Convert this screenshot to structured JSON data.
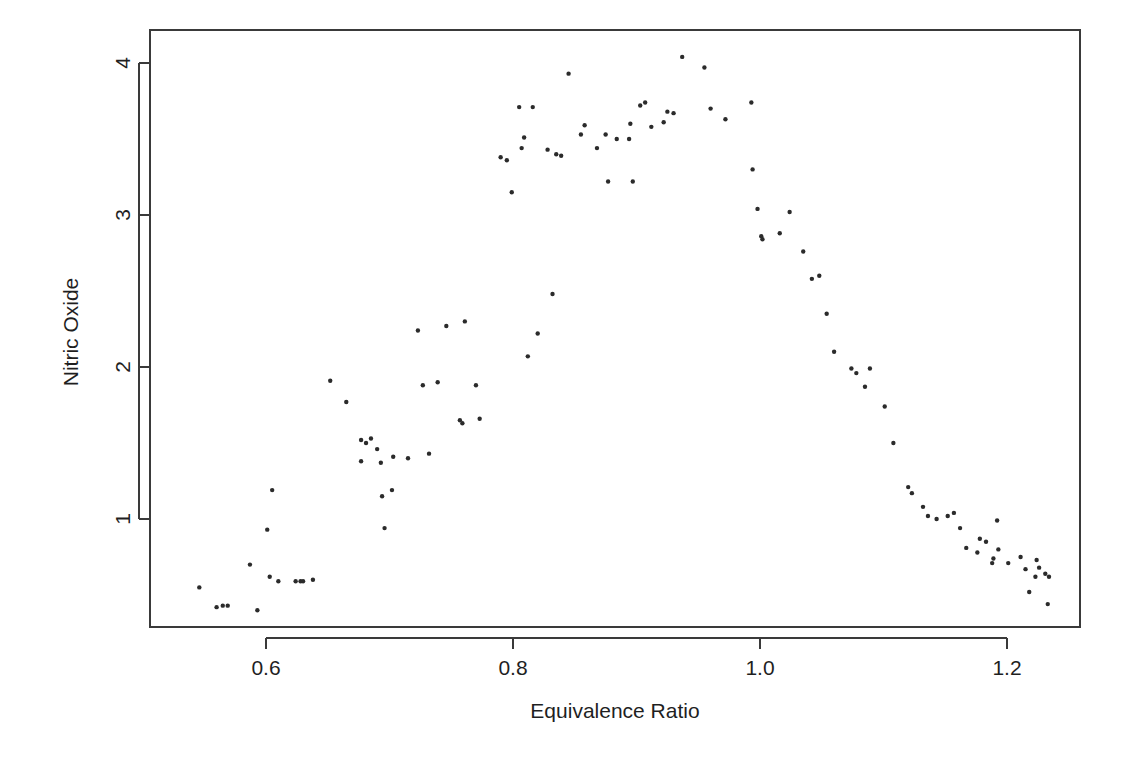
{
  "chart_data": {
    "type": "scatter",
    "title": "",
    "subtitle": "",
    "xlabel": "Equivalence Ratio",
    "ylabel": "Nitric Oxide",
    "xlim": [
      0.515,
      1.245
    ],
    "ylim": [
      0.33,
      4.18
    ],
    "xticks": [
      0.6,
      0.8,
      1.0,
      1.2
    ],
    "xticklabels": [
      "0.6",
      "0.8",
      "1.0",
      "1.2"
    ],
    "yticks": [
      1,
      2,
      3,
      4
    ],
    "yticklabels": [
      "1",
      "2",
      "3",
      "4"
    ],
    "grid": false,
    "legend": null,
    "legend_position": "none",
    "marker": "filled-circle",
    "marker_color": "#2b2b2b",
    "marker_size_px": 4.4,
    "n_points": 88,
    "series": [
      {
        "name": "Nitric Oxide",
        "x": [
          0.907,
          0.761,
          1.108,
          1.016,
          1.189,
          1.001,
          1.231,
          1.123,
          1.042,
          1.215,
          0.93,
          1.152,
          0.693,
          0.839,
          0.759,
          0.835,
          0.994,
          1.101,
          1.189,
          1.132,
          0.993,
          1.223,
          0.723,
          0.677,
          1.002,
          0.681,
          0.855,
          0.839,
          0.732,
          0.79,
          0.895,
          0.912,
          0.937,
          0.805,
          0.807,
          0.955,
          0.799,
          1.189,
          0.816,
          0.922,
          1.089,
          1.035,
          0.739,
          0.875,
          0.624,
          1.201,
          1.188,
          0.828,
          0.998,
          0.858,
          1.048,
          0.757,
          1.074,
          0.727,
          0.77,
          1.189,
          0.894,
          0.96,
          0.546,
          0.773,
          0.677,
          1.182,
          0.795,
          0.603,
          0.702,
          0.897,
          1.224,
          0.628,
          0.569,
          0.593,
          1.143,
          0.746,
          0.677,
          0.703,
          0.63,
          0.567,
          0.56,
          0.565,
          0.61,
          1.192,
          1.178,
          1.162,
          1.193,
          1.183,
          1.176,
          1.226,
          1.218,
          1.211
        ],
        "y": [
          3.741,
          2.295,
          1.498,
          2.881,
          0.76,
          3.12,
          0.638,
          1.17,
          2.358,
          0.671,
          3.67,
          1.018,
          1.37,
          3.54,
          2.3,
          3.4,
          3.3,
          1.87,
          0.74,
          1.08,
          2.88,
          0.62,
          2.24,
          1.4,
          2.84,
          1.34,
          3.53,
          3.39,
          1.43,
          3.38,
          3.6,
          4.04,
          3.97,
          3.71,
          3.44,
          3.73,
          3.15,
          0.78,
          3.71,
          3.61,
          1.99,
          2.44,
          1.9,
          3.53,
          0.59,
          0.71,
          0.71,
          3.43,
          3.04,
          3.59,
          2.58,
          2.08,
          1.99,
          1.88,
          3.35,
          0.84,
          3.5,
          3.7,
          0.55,
          3.4,
          1.38,
          1.01,
          3.36,
          0.62,
          1.19,
          3.22,
          0.73,
          0.59,
          0.43,
          0.4,
          1.0,
          2.27,
          1.14,
          1.65,
          0.59,
          0.43,
          0.42,
          0.94,
          1.2,
          0.99,
          0.87,
          0.94,
          0.8,
          0.85,
          0.78,
          0.68,
          0.52,
          0.75
        ]
      }
    ],
    "points": [
      [
        0.546,
        0.55
      ],
      [
        0.56,
        0.42
      ],
      [
        0.565,
        0.43
      ],
      [
        0.569,
        0.43
      ],
      [
        0.593,
        0.4
      ],
      [
        0.603,
        0.62
      ],
      [
        0.605,
        1.19
      ],
      [
        0.601,
        0.93
      ],
      [
        0.587,
        0.7
      ],
      [
        0.61,
        0.59
      ],
      [
        0.624,
        0.59
      ],
      [
        0.628,
        0.59
      ],
      [
        0.63,
        0.59
      ],
      [
        0.638,
        0.6
      ],
      [
        0.652,
        1.91
      ],
      [
        0.665,
        1.77
      ],
      [
        0.677,
        1.38
      ],
      [
        0.677,
        1.52
      ],
      [
        0.681,
        1.5
      ],
      [
        0.685,
        1.53
      ],
      [
        0.69,
        1.46
      ],
      [
        0.693,
        1.37
      ],
      [
        0.694,
        1.15
      ],
      [
        0.696,
        0.94
      ],
      [
        0.702,
        1.19
      ],
      [
        0.703,
        1.41
      ],
      [
        0.715,
        1.4
      ],
      [
        0.723,
        2.24
      ],
      [
        0.727,
        1.88
      ],
      [
        0.732,
        1.43
      ],
      [
        0.739,
        1.9
      ],
      [
        0.746,
        2.27
      ],
      [
        0.757,
        1.65
      ],
      [
        0.759,
        1.63
      ],
      [
        0.761,
        2.3
      ],
      [
        0.77,
        1.88
      ],
      [
        0.773,
        1.66
      ],
      [
        0.79,
        3.38
      ],
      [
        0.795,
        3.36
      ],
      [
        0.799,
        3.15
      ],
      [
        0.805,
        3.71
      ],
      [
        0.807,
        3.44
      ],
      [
        0.809,
        3.51
      ],
      [
        0.812,
        2.07
      ],
      [
        0.816,
        3.71
      ],
      [
        0.82,
        2.22
      ],
      [
        0.828,
        3.43
      ],
      [
        0.832,
        2.48
      ],
      [
        0.835,
        3.4
      ],
      [
        0.839,
        3.39
      ],
      [
        0.845,
        3.93
      ],
      [
        0.855,
        3.53
      ],
      [
        0.858,
        3.59
      ],
      [
        0.868,
        3.44
      ],
      [
        0.875,
        3.53
      ],
      [
        0.877,
        3.22
      ],
      [
        0.884,
        3.5
      ],
      [
        0.894,
        3.5
      ],
      [
        0.895,
        3.6
      ],
      [
        0.897,
        3.22
      ],
      [
        0.903,
        3.72
      ],
      [
        0.907,
        3.74
      ],
      [
        0.912,
        3.58
      ],
      [
        0.922,
        3.61
      ],
      [
        0.925,
        3.68
      ],
      [
        0.93,
        3.67
      ],
      [
        0.937,
        4.04
      ],
      [
        0.955,
        3.97
      ],
      [
        0.96,
        3.7
      ],
      [
        0.972,
        3.63
      ],
      [
        0.993,
        3.74
      ],
      [
        0.994,
        3.3
      ],
      [
        0.998,
        3.04
      ],
      [
        1.001,
        2.86
      ],
      [
        1.002,
        2.84
      ],
      [
        1.016,
        2.88
      ],
      [
        1.024,
        3.02
      ],
      [
        1.035,
        2.76
      ],
      [
        1.042,
        2.58
      ],
      [
        1.048,
        2.6
      ],
      [
        1.054,
        2.35
      ],
      [
        1.06,
        2.1
      ],
      [
        1.074,
        1.99
      ],
      [
        1.078,
        1.96
      ],
      [
        1.085,
        1.87
      ],
      [
        1.089,
        1.99
      ],
      [
        1.101,
        1.74
      ],
      [
        1.108,
        1.5
      ],
      [
        1.12,
        1.21
      ],
      [
        1.123,
        1.17
      ],
      [
        1.132,
        1.08
      ],
      [
        1.136,
        1.02
      ],
      [
        1.143,
        1.0
      ],
      [
        1.152,
        1.02
      ],
      [
        1.157,
        1.04
      ],
      [
        1.162,
        0.94
      ],
      [
        1.167,
        0.81
      ],
      [
        1.176,
        0.78
      ],
      [
        1.178,
        0.87
      ],
      [
        1.183,
        0.85
      ],
      [
        1.188,
        0.71
      ],
      [
        1.189,
        0.74
      ],
      [
        1.192,
        0.99
      ],
      [
        1.193,
        0.8
      ],
      [
        1.201,
        0.71
      ],
      [
        1.211,
        0.75
      ],
      [
        1.215,
        0.67
      ],
      [
        1.218,
        0.52
      ],
      [
        1.223,
        0.62
      ],
      [
        1.224,
        0.73
      ],
      [
        1.226,
        0.68
      ],
      [
        1.231,
        0.64
      ],
      [
        1.233,
        0.44
      ],
      [
        1.234,
        0.62
      ]
    ]
  },
  "axes": {
    "x_axis_name": "Equivalence Ratio",
    "y_axis_name": "Nitric Oxide"
  }
}
